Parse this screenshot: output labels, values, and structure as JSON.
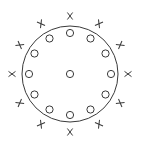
{
  "diagram": {
    "title": "",
    "colors": {
      "stroke": "#3a3a3a",
      "background": "#ffffff"
    },
    "boundary_circle": {
      "cx": 70,
      "cy": 74,
      "r": 48
    },
    "inner_markers": {
      "symbol": "o",
      "count": 13,
      "ring_radius": 41,
      "marker_radius": 3.6,
      "angles_deg": [
        -90,
        -60,
        -30,
        0,
        30,
        60,
        90,
        120,
        150,
        180,
        210,
        240
      ],
      "center_marker": true
    },
    "outer_markers": {
      "symbol": "x",
      "count": 12,
      "ring_radius": 58,
      "marker_half_size": 3.5,
      "angles_deg": [
        -90,
        -60,
        -30,
        0,
        30,
        60,
        90,
        120,
        150,
        180,
        210,
        240
      ]
    }
  }
}
